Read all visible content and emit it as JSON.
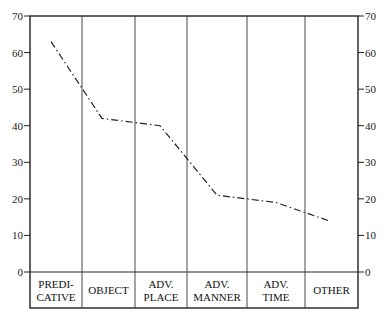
{
  "chart_data": {
    "type": "line",
    "title": "",
    "xlabel": "",
    "ylabel": "",
    "categories": [
      [
        "PREDI-",
        "CATIVE"
      ],
      [
        "OBJECT"
      ],
      [
        "ADV.",
        "PLACE"
      ],
      [
        "ADV.",
        "MANNER"
      ],
      [
        "ADV.",
        "TIME"
      ],
      [
        "OTHER"
      ]
    ],
    "category_names": [
      "PREDICATIVE",
      "OBJECT",
      "ADV. PLACE",
      "ADV. MANNER",
      "ADV. TIME",
      "OTHER"
    ],
    "series": [
      {
        "name": "",
        "style": "dash-dot",
        "values": [
          63,
          42,
          40,
          21,
          19,
          14
        ]
      }
    ],
    "ylim": [
      0,
      70
    ],
    "yticks": [
      0,
      10,
      20,
      30,
      40,
      50,
      60,
      70
    ],
    "y_axis_both_sides": true,
    "grid": false,
    "legend": null
  }
}
